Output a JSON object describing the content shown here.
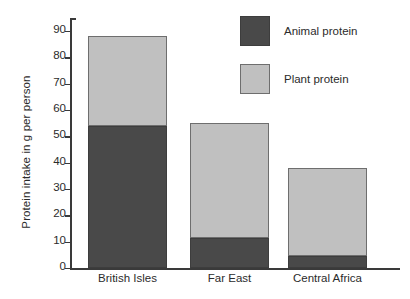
{
  "chart_data": {
    "type": "bar",
    "subtype": "stacked-bar",
    "title": "",
    "xlabel": "",
    "ylabel": "Protein intake in g per person",
    "categories": [
      "British Isles",
      "Far East",
      "Central Africa"
    ],
    "series": [
      {
        "name": "Animal protein",
        "values": [
          54,
          11.5,
          4.5
        ],
        "color": "#494949"
      },
      {
        "name": "Plant protein",
        "values": [
          34,
          43.5,
          33.5
        ],
        "color": "#c0c0c0"
      }
    ],
    "totals": [
      88,
      55,
      38
    ],
    "ylim": [
      0,
      95
    ],
    "yticks": [
      0,
      10,
      20,
      30,
      40,
      50,
      60,
      70,
      80,
      90
    ],
    "ytick_labels": [
      "0",
      "10",
      "20",
      "30",
      "40",
      "50",
      "60",
      "70",
      "80",
      "90"
    ],
    "grid": false,
    "legend": {
      "position": "top-right",
      "entries": [
        {
          "label": "Animal protein",
          "color": "#494949"
        },
        {
          "label": "Plant protein",
          "color": "#c0c0c0"
        }
      ]
    },
    "axis_color": "#3a3a3a",
    "background": "#ffffff"
  }
}
